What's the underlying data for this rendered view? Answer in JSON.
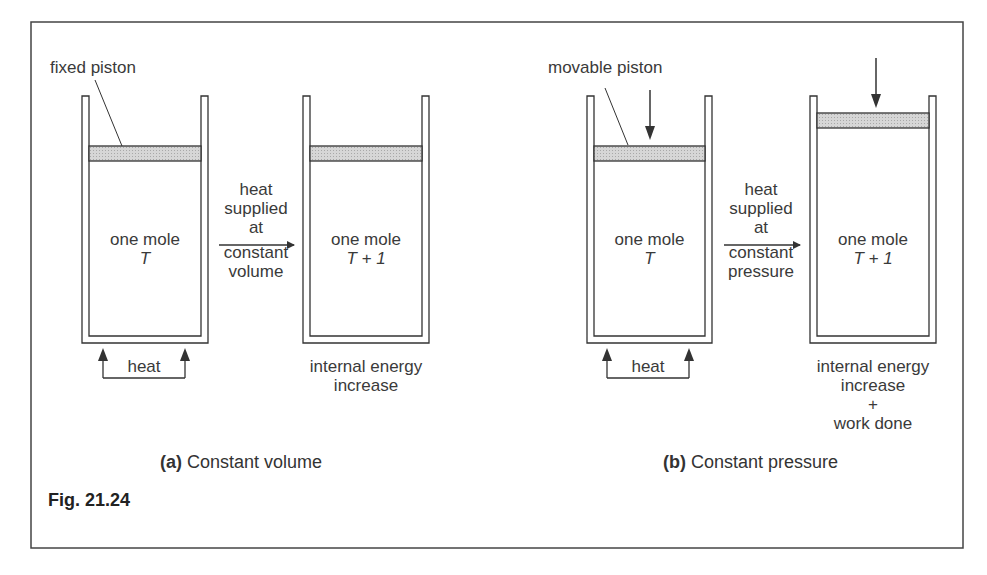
{
  "figure": {
    "label": "Fig. 21.24"
  },
  "panel_a": {
    "caption_letter": "(a)",
    "caption_text": "Constant volume",
    "piston_label": "fixed piston",
    "before": {
      "line1": "one mole",
      "line2": "T"
    },
    "after": {
      "line1": "one mole",
      "line2": "T + 1"
    },
    "heat_label": "heat",
    "process_label": [
      "heat",
      "supplied",
      "at",
      "constant",
      "volume"
    ],
    "result_label": [
      "internal energy",
      "increase"
    ]
  },
  "panel_b": {
    "caption_letter": "(b)",
    "caption_text": "Constant pressure",
    "piston_label": "movable piston",
    "before": {
      "line1": "one mole",
      "line2": "T"
    },
    "after": {
      "line1": "one mole",
      "line2": "T + 1"
    },
    "heat_label": "heat",
    "process_label": [
      "heat",
      "supplied",
      "at",
      "constant",
      "pressure"
    ],
    "result_label": [
      "internal energy",
      "increase",
      "+",
      "work done"
    ]
  },
  "colors": {
    "line": "#333333",
    "piston_fill": "#cfcfcf",
    "frame": "#444444"
  }
}
